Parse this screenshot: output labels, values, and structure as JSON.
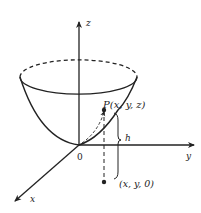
{
  "diagram": {
    "type": "3d-paraboloid",
    "axes": {
      "z_label": "z",
      "y_label": "y",
      "x_label": "x",
      "origin_label": "0"
    },
    "points": {
      "P_label": "P(x, y, z)",
      "projection_label": "(x, y, 0)"
    },
    "height_label": "h",
    "colors": {
      "stroke": "#222222",
      "background": "#ffffff"
    }
  }
}
